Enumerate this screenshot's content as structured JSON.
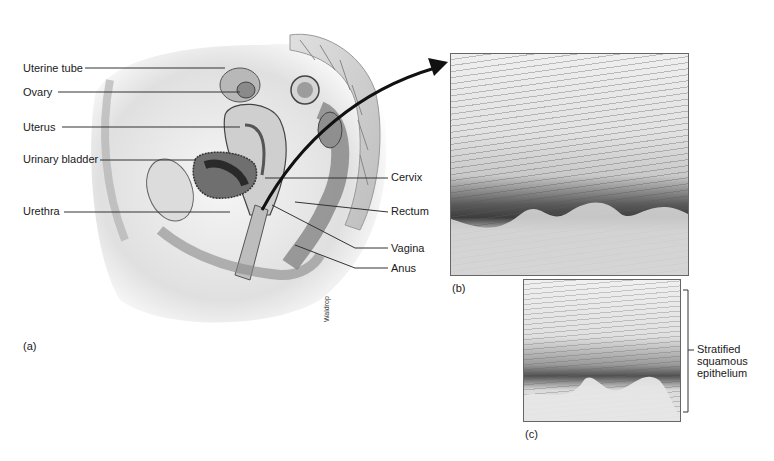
{
  "figure": {
    "panel_a": {
      "label": "(a)",
      "credit": "Waldrop",
      "labels_left": [
        {
          "text": "Uterine tube",
          "y": 68
        },
        {
          "text": "Ovary",
          "y": 92
        },
        {
          "text": "Uterus",
          "y": 127
        },
        {
          "text": "Urinary bladder",
          "y": 159
        },
        {
          "text": "Urethra",
          "y": 211
        }
      ],
      "labels_right": [
        {
          "text": "Cervix",
          "y": 177
        },
        {
          "text": "Rectum",
          "y": 211
        },
        {
          "text": "Vagina",
          "y": 248
        },
        {
          "text": "Anus",
          "y": 268
        }
      ]
    },
    "panel_b": {
      "label": "(b)"
    },
    "panel_c": {
      "label": "(c)"
    },
    "bracket_label": {
      "line1": "Stratified",
      "line2": "squamous",
      "line3": "epithelium"
    }
  }
}
